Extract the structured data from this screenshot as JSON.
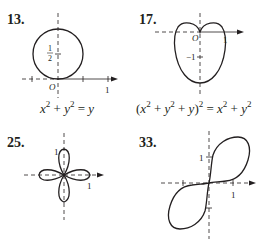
{
  "figures": [
    {
      "id": "13",
      "number_label": "13.",
      "equation": {
        "parts": [
          "x",
          "2",
          " + ",
          "y",
          "2",
          " = ",
          "y"
        ],
        "text": "x^2 + y^2 = y"
      },
      "origin_label": "O",
      "axis_labels": {
        "x_tick": "1",
        "y_tick_num": "1",
        "y_tick_den": "2"
      },
      "curve": "circle"
    },
    {
      "id": "17",
      "number_label": "17.",
      "equation": {
        "text": "(x^2 + y^2 + y)^2 = x^2 + y^2",
        "parts": [
          "(",
          "x",
          "2",
          " + ",
          "y",
          "2",
          " + ",
          "y",
          ")",
          "2",
          " = ",
          "x",
          "2",
          " + ",
          "y",
          "2"
        ]
      },
      "origin_label": "O",
      "axis_labels": {
        "x_tick": "1",
        "y_tick": "−1"
      },
      "curve": "cardioid"
    },
    {
      "id": "25",
      "number_label": "25.",
      "axis_labels": {
        "x_tick": "1",
        "y_tick": "1"
      },
      "curve": "four-leaved rose"
    },
    {
      "id": "33",
      "number_label": "33.",
      "axis_labels": {
        "x_tick": "1",
        "y_tick": "1"
      },
      "curve": "lemniscate"
    }
  ],
  "colors": {
    "ink": "#231f20",
    "background": "#ffffff"
  }
}
